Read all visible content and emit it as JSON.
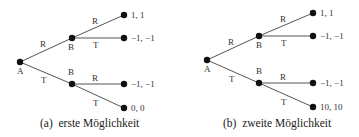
{
  "diagrams": [
    {
      "caption": "(a)  erste Möglichkeit",
      "root": "A",
      "nodes": {
        "upper": "B",
        "lower": "B"
      },
      "edges": {
        "root_upper": "R",
        "root_lower": "T",
        "upper_r": "R",
        "upper_t": "T",
        "lower_r": "R",
        "lower_t": "T"
      },
      "payoffs": [
        "1, 1",
        "−1, −1",
        "−1, −1",
        "0, 0"
      ]
    },
    {
      "caption": "(b)  zweite Möglichkeit",
      "root": "A",
      "nodes": {
        "upper": "B",
        "lower": "B"
      },
      "edges": {
        "root_upper": "R",
        "root_lower": "T",
        "upper_r": "R",
        "upper_t": "T",
        "lower_r": "R",
        "lower_t": "T"
      },
      "payoffs": [
        "1, 1",
        "−1, −1",
        "−1, −1",
        "10, 10"
      ]
    }
  ]
}
